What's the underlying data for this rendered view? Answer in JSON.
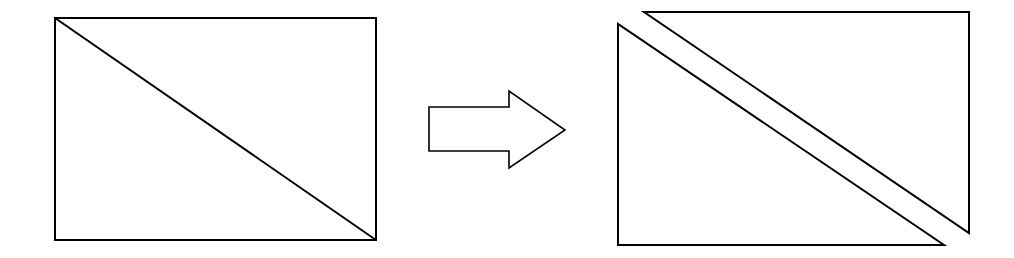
{
  "diagram": {
    "stroke_color": "#000000",
    "background_color": "#ffffff",
    "left": {
      "shape": "rectangle-with-diagonal",
      "rect": {
        "x": 55,
        "y": 18,
        "width": 321,
        "height": 222
      },
      "diagonal": {
        "x1": 55,
        "y1": 18,
        "x2": 376,
        "y2": 240
      }
    },
    "arrow": {
      "direction": "right",
      "points": "429,107 509,107 509,91 565,130 509,168 509,151 429,151"
    },
    "right": {
      "lower_triangle": {
        "points": "618,24 618,245 944,245"
      },
      "upper_triangle": {
        "points": "644,12 969,12 969,233"
      }
    }
  }
}
